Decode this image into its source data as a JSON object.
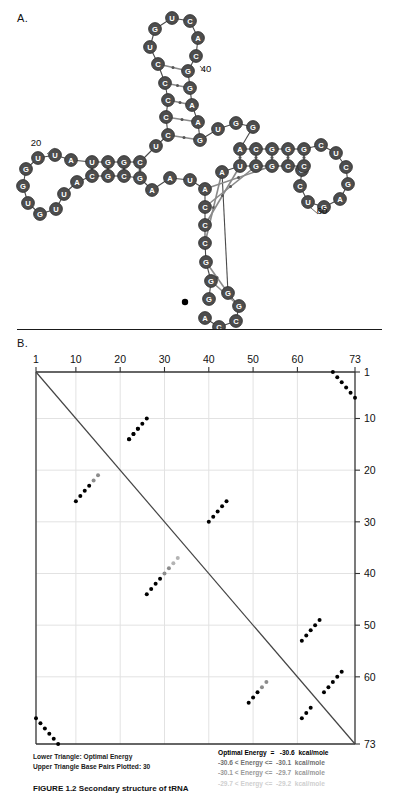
{
  "figure": {
    "panel_a_label": "A.",
    "panel_b_label": "B.",
    "caption": "FIGURE 1.2   Secondary structure of tRNA"
  },
  "panel_a": {
    "title": "RNA secondary structure",
    "sequence_markers": [
      {
        "label": "20",
        "x": 36,
        "y": 146
      },
      {
        "label": "40",
        "x": 206,
        "y": 72
      },
      {
        "label": "60",
        "x": 322,
        "y": 214
      }
    ],
    "nucleotides": [
      {
        "i": 1,
        "b": "G",
        "x": 209,
        "y": 299,
        "shade": "dark"
      },
      {
        "i": 2,
        "b": "G",
        "x": 211,
        "y": 281,
        "shade": "dark"
      },
      {
        "i": 3,
        "b": "G",
        "x": 206,
        "y": 262,
        "shade": "dark"
      },
      {
        "i": 4,
        "b": "C",
        "x": 205,
        "y": 243,
        "shade": "dark"
      },
      {
        "i": 5,
        "b": "C",
        "x": 205,
        "y": 225,
        "shade": "dark"
      },
      {
        "i": 6,
        "b": "C",
        "x": 205,
        "y": 207,
        "shade": "dark"
      },
      {
        "i": 7,
        "b": "A",
        "x": 205,
        "y": 189,
        "shade": "dark"
      },
      {
        "i": 8,
        "b": "U",
        "x": 190,
        "y": 180,
        "shade": "dark"
      },
      {
        "i": 9,
        "b": "A",
        "x": 170,
        "y": 178,
        "shade": "dark"
      },
      {
        "i": 10,
        "b": "A",
        "x": 152,
        "y": 190,
        "shade": "dark"
      },
      {
        "i": 11,
        "b": "G",
        "x": 140,
        "y": 178,
        "shade": "dark"
      },
      {
        "i": 12,
        "b": "C",
        "x": 124,
        "y": 176,
        "shade": "dark"
      },
      {
        "i": 13,
        "b": "G",
        "x": 108,
        "y": 176,
        "shade": "dark"
      },
      {
        "i": 14,
        "b": "C",
        "x": 92,
        "y": 176,
        "shade": "dark"
      },
      {
        "i": 15,
        "b": "A",
        "x": 77,
        "y": 182,
        "shade": "dark"
      },
      {
        "i": 16,
        "b": "U",
        "x": 64,
        "y": 194,
        "shade": "dark"
      },
      {
        "i": 17,
        "b": "U",
        "x": 56,
        "y": 209,
        "shade": "dark"
      },
      {
        "i": 18,
        "b": "G",
        "x": 40,
        "y": 214,
        "shade": "dark"
      },
      {
        "i": 19,
        "b": "U",
        "x": 28,
        "y": 203,
        "shade": "dark"
      },
      {
        "i": 20,
        "b": "G",
        "x": 23,
        "y": 186,
        "shade": "dark"
      },
      {
        "i": 21,
        "b": "G",
        "x": 26,
        "y": 169,
        "shade": "dark"
      },
      {
        "i": 22,
        "b": "U",
        "x": 38,
        "y": 158,
        "shade": "dark"
      },
      {
        "i": 23,
        "b": "U",
        "x": 55,
        "y": 155,
        "shade": "dark"
      },
      {
        "i": 24,
        "b": "A",
        "x": 71,
        "y": 160,
        "shade": "dark"
      },
      {
        "i": 25,
        "b": "U",
        "x": 92,
        "y": 162,
        "shade": "dark"
      },
      {
        "i": 26,
        "b": "G",
        "x": 108,
        "y": 162,
        "shade": "dark"
      },
      {
        "i": 27,
        "b": "G",
        "x": 124,
        "y": 162,
        "shade": "dark"
      },
      {
        "i": 28,
        "b": "C",
        "x": 140,
        "y": 162,
        "shade": "dark"
      },
      {
        "i": 29,
        "b": "U",
        "x": 156,
        "y": 146,
        "shade": "dark"
      },
      {
        "i": 30,
        "b": "C",
        "x": 168,
        "y": 135,
        "shade": "dark"
      },
      {
        "i": 31,
        "b": "C",
        "x": 166,
        "y": 117,
        "shade": "dark"
      },
      {
        "i": 32,
        "b": "C",
        "x": 168,
        "y": 100,
        "shade": "dark"
      },
      {
        "i": 33,
        "b": "C",
        "x": 165,
        "y": 83,
        "shade": "dark"
      },
      {
        "i": 34,
        "b": "C",
        "x": 158,
        "y": 64,
        "shade": "dark"
      },
      {
        "i": 35,
        "b": "U",
        "x": 150,
        "y": 47,
        "shade": "dark"
      },
      {
        "i": 36,
        "b": "G",
        "x": 155,
        "y": 29,
        "shade": "dark"
      },
      {
        "i": 37,
        "b": "U",
        "x": 172,
        "y": 18,
        "shade": "dark"
      },
      {
        "i": 38,
        "b": "C",
        "x": 190,
        "y": 21,
        "shade": "dark"
      },
      {
        "i": 39,
        "b": "A",
        "x": 198,
        "y": 38,
        "shade": "dark"
      },
      {
        "i": 40,
        "b": "C",
        "x": 196,
        "y": 56,
        "shade": "dark"
      },
      {
        "i": 41,
        "b": "G",
        "x": 188,
        "y": 71,
        "shade": "dark"
      },
      {
        "i": 42,
        "b": "G",
        "x": 190,
        "y": 88,
        "shade": "dark"
      },
      {
        "i": 43,
        "b": "A",
        "x": 192,
        "y": 105,
        "shade": "dark"
      },
      {
        "i": 44,
        "b": "A",
        "x": 198,
        "y": 122,
        "shade": "dark"
      },
      {
        "i": 45,
        "b": "G",
        "x": 200,
        "y": 140,
        "shade": "dark"
      },
      {
        "i": 46,
        "b": "U",
        "x": 218,
        "y": 129,
        "shade": "dark"
      },
      {
        "i": 47,
        "b": "G",
        "x": 236,
        "y": 123,
        "shade": "dark"
      },
      {
        "i": 48,
        "b": "G",
        "x": 253,
        "y": 127,
        "shade": "dark"
      },
      {
        "i": 49,
        "b": "A",
        "x": 240,
        "y": 149,
        "shade": "dark"
      },
      {
        "i": 50,
        "b": "C",
        "x": 256,
        "y": 149,
        "shade": "dark"
      },
      {
        "i": 51,
        "b": "G",
        "x": 272,
        "y": 149,
        "shade": "dark"
      },
      {
        "i": 52,
        "b": "G",
        "x": 288,
        "y": 149,
        "shade": "dark"
      },
      {
        "i": 53,
        "b": "G",
        "x": 304,
        "y": 149,
        "shade": "dark"
      },
      {
        "i": 54,
        "b": "C",
        "x": 321,
        "y": 145,
        "shade": "dark"
      },
      {
        "i": 55,
        "b": "U",
        "x": 336,
        "y": 153,
        "shade": "dark"
      },
      {
        "i": 56,
        "b": "C",
        "x": 346,
        "y": 167,
        "shade": "dark"
      },
      {
        "i": 57,
        "b": "G",
        "x": 348,
        "y": 184,
        "shade": "dark"
      },
      {
        "i": 58,
        "b": "A",
        "x": 340,
        "y": 199,
        "shade": "dark"
      },
      {
        "i": 59,
        "b": "G",
        "x": 324,
        "y": 207,
        "shade": "dark"
      },
      {
        "i": 60,
        "b": "U",
        "x": 308,
        "y": 202,
        "shade": "dark"
      },
      {
        "i": 61,
        "b": "C",
        "x": 300,
        "y": 186,
        "shade": "dark"
      },
      {
        "i": 62,
        "b": "G",
        "x": 302,
        "y": 170,
        "shade": "dark"
      },
      {
        "i": 63,
        "b": "C",
        "x": 304,
        "y": 166,
        "shade": "dark"
      },
      {
        "i": 64,
        "b": "C",
        "x": 288,
        "y": 166,
        "shade": "dark"
      },
      {
        "i": 65,
        "b": "G",
        "x": 272,
        "y": 166,
        "shade": "dark"
      },
      {
        "i": 66,
        "b": "G",
        "x": 256,
        "y": 166,
        "shade": "dark"
      },
      {
        "i": 67,
        "b": "U",
        "x": 240,
        "y": 166,
        "shade": "dark"
      },
      {
        "i": 68,
        "b": "A",
        "x": 222,
        "y": 172,
        "shade": "dark"
      },
      {
        "i": 69,
        "b": "G",
        "x": 228,
        "y": 293,
        "shade": "dark"
      },
      {
        "i": 70,
        "b": "G",
        "x": 239,
        "y": 306,
        "shade": "dark"
      },
      {
        "i": 71,
        "b": "C",
        "x": 236,
        "y": 321,
        "shade": "dark"
      },
      {
        "i": 72,
        "b": "C",
        "x": 219,
        "y": 327,
        "shade": "dark"
      },
      {
        "i": 73,
        "b": "A",
        "x": 205,
        "y": 318,
        "shade": "dark"
      }
    ]
  },
  "panel_b": {
    "axis_top_ticks": [
      "1",
      "10",
      "20",
      "30",
      "40",
      "50",
      "60",
      "73"
    ],
    "axis_right_ticks": [
      "1",
      "10",
      "20",
      "30",
      "40",
      "50",
      "60",
      "73"
    ],
    "axis_min": 1,
    "axis_max": 73,
    "legend_left": [
      "Lower Triangle: Optimal Energy",
      "Upper Triangle Base Pairs Plotted: 30"
    ],
    "legend_right": [
      "Optimal Energy  =   -30.6  kcal/mole",
      "-30.6 < Energy <=  -30.1  kcal/mole",
      "-30.1 < Energy <=  -29.7  kcal/mole",
      "-29.7 < Energy <=  -29.2  kcal/mole"
    ]
  },
  "chart_data": {
    "type": "scatter",
    "xlabel": "",
    "ylabel": "",
    "xlim": [
      1,
      73
    ],
    "ylim": [
      1,
      73
    ],
    "grid": true,
    "legend_position": "below",
    "series": [
      {
        "name": "Optimal Energy (lower triangle)",
        "color": "#000000",
        "points": [
          [
            1,
            68
          ],
          [
            2,
            69
          ],
          [
            3,
            70
          ],
          [
            4,
            71
          ],
          [
            5,
            72
          ],
          [
            6,
            73
          ],
          [
            10,
            26
          ],
          [
            11,
            25
          ],
          [
            12,
            24
          ],
          [
            13,
            23
          ],
          [
            14,
            22
          ],
          [
            26,
            44
          ],
          [
            27,
            43
          ],
          [
            28,
            42
          ],
          [
            29,
            41
          ],
          [
            30,
            40
          ],
          [
            49,
            65
          ],
          [
            50,
            64
          ],
          [
            51,
            63
          ],
          [
            52,
            62
          ],
          [
            53,
            61
          ],
          [
            59,
            70
          ],
          [
            60,
            69
          ],
          [
            61,
            68
          ],
          [
            62,
            67
          ],
          [
            63,
            66
          ]
        ]
      },
      {
        "name": "Base pairs plotted (upper triangle, -30.6 kcal/mole)",
        "color": "#000000",
        "points": [
          [
            1,
            68
          ],
          [
            2,
            69
          ],
          [
            3,
            70
          ],
          [
            4,
            71
          ],
          [
            5,
            72
          ],
          [
            6,
            73
          ],
          [
            10,
            26
          ],
          [
            11,
            25
          ],
          [
            12,
            24
          ],
          [
            13,
            23
          ],
          [
            22,
            14
          ],
          [
            23,
            13
          ],
          [
            24,
            12
          ],
          [
            26,
            44
          ],
          [
            27,
            43
          ],
          [
            28,
            42
          ],
          [
            29,
            41
          ],
          [
            49,
            65
          ],
          [
            50,
            64
          ],
          [
            51,
            63
          ],
          [
            61,
            68
          ],
          [
            62,
            67
          ],
          [
            63,
            66
          ]
        ]
      },
      {
        "name": "-30.6 < Energy <= -30.1",
        "color": "#8c8c8c",
        "points": [
          [
            14,
            22
          ],
          [
            15,
            21
          ],
          [
            30,
            40
          ],
          [
            31,
            39
          ],
          [
            52,
            62
          ],
          [
            53,
            61
          ]
        ]
      },
      {
        "name": "-30.1 < Energy <= -29.7",
        "color": "#b4b4b4",
        "points": [
          [
            32,
            38
          ],
          [
            33,
            37
          ]
        ]
      }
    ]
  }
}
